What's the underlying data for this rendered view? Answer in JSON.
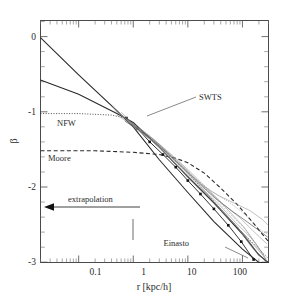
{
  "figure": {
    "name": "density-slope-profile-plot",
    "background": "#ffffff",
    "foreground": "#2b2b2b"
  },
  "chart_data": {
    "type": "line",
    "title": "",
    "subtitle": "",
    "xlabel": "r [kpc/h]",
    "ylabel": "β",
    "xscale": "log",
    "yscale": "linear",
    "xlim": [
      0.02,
      300
    ],
    "ylim": [
      -3,
      0.25
    ],
    "grid": false,
    "legend_position": "inline-annotations",
    "xticks": [
      0.1,
      1,
      10,
      100
    ],
    "xtick_labels": [
      "0.1",
      "1",
      "10",
      "100"
    ],
    "yticks": [
      0,
      -1,
      -2,
      -3
    ],
    "ytick_labels": [
      "0",
      "-1",
      "-2",
      "-3"
    ],
    "annotations": [
      {
        "text": "SWTS",
        "x": 30,
        "y": -0.92,
        "leader_to_x": 2.2,
        "leader_to_y": -1.12
      },
      {
        "text": "NFW",
        "x": 0.16,
        "y": -1.17,
        "leader_to_x": null,
        "leader_to_y": null
      },
      {
        "text": "Moore",
        "x": 0.14,
        "y": -1.63,
        "leader_to_x": null,
        "leader_to_y": null
      },
      {
        "text": "extrapolation",
        "x": 0.22,
        "y": -2.18,
        "leader_to_x": null,
        "leader_to_y": null
      },
      {
        "text": "Einasto",
        "x": 33,
        "y": -2.78,
        "leader_to_x": 135,
        "leader_to_y": -2.95
      }
    ],
    "series": [
      {
        "name": "Einasto",
        "style": "solid",
        "weight": "model",
        "x": [
          0.02,
          0.1,
          0.5,
          1,
          3,
          10,
          30,
          100,
          200,
          300
        ],
        "values": [
          0.02,
          -0.48,
          -0.96,
          -1.18,
          -1.62,
          -2.06,
          -2.45,
          -2.82,
          -3.0,
          -3.0
        ]
      },
      {
        "name": "SWTS",
        "style": "solid",
        "weight": "model",
        "x": [
          0.02,
          0.1,
          0.5,
          1,
          3,
          10,
          30,
          100,
          200,
          300
        ],
        "values": [
          -0.55,
          -0.74,
          -1.0,
          -1.12,
          -1.45,
          -1.85,
          -2.2,
          -2.62,
          -2.9,
          -3.0
        ]
      },
      {
        "name": "NFW",
        "style": "dotted",
        "weight": "model",
        "x": [
          0.02,
          0.1,
          0.4,
          0.7,
          1,
          3,
          10,
          30,
          100,
          300
        ],
        "values": [
          -1.0,
          -1.0,
          -1.02,
          -1.06,
          -1.14,
          -1.42,
          -1.8,
          -2.18,
          -2.6,
          -2.95
        ]
      },
      {
        "name": "Moore",
        "style": "dashed",
        "weight": "model",
        "x": [
          0.02,
          0.2,
          1,
          3,
          6,
          10,
          20,
          40,
          80,
          150,
          300
        ],
        "values": [
          -1.5,
          -1.5,
          -1.52,
          -1.55,
          -1.6,
          -1.66,
          -1.8,
          -2.0,
          -2.22,
          -2.45,
          -2.72
        ]
      },
      {
        "name": "simulation-mean",
        "style": "solid-markers",
        "weight": "dark",
        "x": [
          0.75,
          1.2,
          2,
          3.5,
          6,
          10,
          17,
          30,
          55,
          95,
          160
        ],
        "values": [
          -1.06,
          -1.2,
          -1.38,
          -1.55,
          -1.72,
          -1.9,
          -2.08,
          -2.28,
          -2.5,
          -2.72,
          -2.96
        ]
      },
      {
        "name": "halo-1",
        "style": "solid",
        "weight": "thin",
        "x": [
          0.6,
          1.2,
          2.5,
          5,
          10,
          20,
          40,
          80,
          150,
          260
        ],
        "values": [
          -0.98,
          -1.2,
          -1.4,
          -1.62,
          -1.86,
          -2.08,
          -2.3,
          -2.52,
          -2.8,
          -2.98
        ]
      },
      {
        "name": "halo-2",
        "style": "solid",
        "weight": "thin",
        "x": [
          0.5,
          1,
          2,
          4,
          9,
          18,
          35,
          70,
          140,
          250
        ],
        "values": [
          -1.02,
          -1.16,
          -1.33,
          -1.52,
          -1.78,
          -2.0,
          -2.2,
          -2.44,
          -2.66,
          -2.9
        ]
      },
      {
        "name": "halo-3",
        "style": "solid",
        "weight": "mid",
        "x": [
          0.7,
          1.5,
          3,
          6,
          12,
          25,
          50,
          100,
          180,
          280
        ],
        "values": [
          -1.1,
          -1.26,
          -1.45,
          -1.68,
          -1.9,
          -2.12,
          -2.36,
          -2.6,
          -2.85,
          -3.0
        ]
      },
      {
        "name": "halo-4",
        "style": "solid",
        "weight": "thin",
        "x": [
          0.4,
          0.9,
          2,
          5,
          11,
          22,
          45,
          90,
          170,
          280
        ],
        "values": [
          -0.9,
          -1.12,
          -1.3,
          -1.55,
          -1.78,
          -2.0,
          -2.22,
          -2.4,
          -2.6,
          -2.75
        ]
      },
      {
        "name": "halo-5",
        "style": "dotted",
        "weight": "thin",
        "x": [
          0.8,
          1.6,
          3.5,
          7,
          14,
          28,
          55,
          110,
          200,
          290
        ],
        "values": [
          -1.08,
          -1.24,
          -1.46,
          -1.66,
          -1.88,
          -2.05,
          -2.18,
          -2.35,
          -2.55,
          -2.62
        ]
      },
      {
        "name": "halo-6",
        "style": "solid",
        "weight": "thin",
        "x": [
          0.55,
          1.1,
          2.2,
          4.5,
          9,
          19,
          38,
          75,
          150,
          270
        ],
        "values": [
          -1.0,
          -1.18,
          -1.36,
          -1.58,
          -1.8,
          -2.04,
          -2.26,
          -2.5,
          -2.74,
          -2.95
        ]
      },
      {
        "name": "halo-7",
        "style": "solid",
        "weight": "mid",
        "x": [
          0.9,
          1.8,
          3.8,
          8,
          16,
          32,
          62,
          120,
          210,
          290
        ],
        "values": [
          -1.14,
          -1.3,
          -1.5,
          -1.72,
          -1.94,
          -2.14,
          -2.3,
          -2.45,
          -2.58,
          -2.66
        ]
      },
      {
        "name": "halo-8",
        "style": "solid",
        "weight": "thin",
        "x": [
          0.45,
          1.0,
          2.4,
          5.5,
          12,
          26,
          52,
          105,
          190,
          285
        ],
        "values": [
          -0.95,
          -1.15,
          -1.35,
          -1.6,
          -1.84,
          -2.06,
          -2.28,
          -2.52,
          -2.78,
          -2.99
        ]
      },
      {
        "name": "halo-9",
        "style": "solid",
        "weight": "thin",
        "x": [
          1.0,
          2.0,
          4.2,
          9,
          18,
          36,
          70,
          135,
          230,
          295
        ],
        "values": [
          -1.18,
          -1.34,
          -1.54,
          -1.76,
          -1.96,
          -2.1,
          -2.2,
          -2.3,
          -2.42,
          -2.5
        ]
      },
      {
        "name": "halo-10",
        "style": "dotted",
        "weight": "thin",
        "x": [
          0.65,
          1.4,
          3.2,
          7.5,
          15,
          30,
          58,
          115,
          205,
          292
        ],
        "values": [
          -1.04,
          -1.22,
          -1.44,
          -1.68,
          -1.9,
          -2.12,
          -2.34,
          -2.56,
          -2.82,
          -3.0
        ]
      }
    ]
  },
  "axes": {
    "x_axis_name": "r-axis",
    "y_axis_name": "beta-axis"
  },
  "extrapolation_arrow": {
    "label": "extrapolation",
    "direction": "left"
  }
}
